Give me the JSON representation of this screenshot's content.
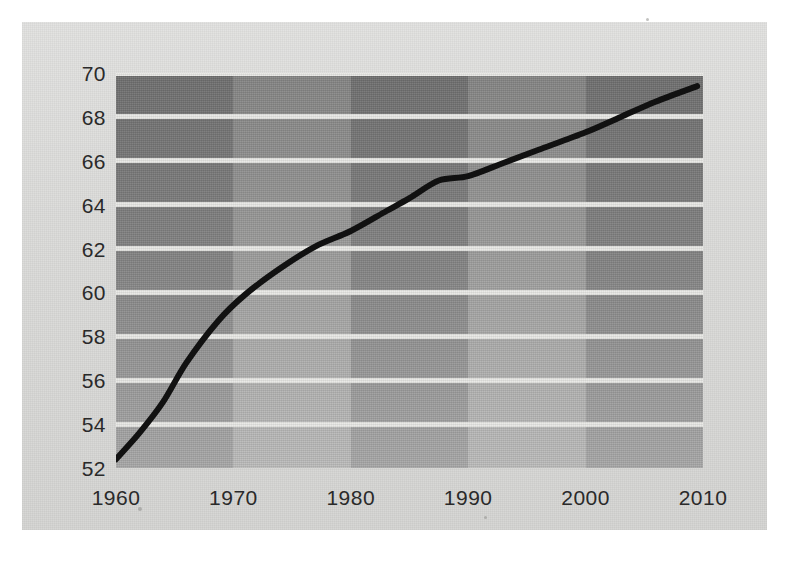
{
  "chart_data": {
    "type": "line",
    "title": "",
    "subtitle": "",
    "xlabel": "",
    "ylabel": "",
    "xlim": [
      1960,
      2010
    ],
    "ylim": [
      52,
      70
    ],
    "grid": true,
    "legend": false,
    "legend_position": "none",
    "line_color": "#111111",
    "line_width_px": 6,
    "x_ticks": [
      1960,
      1970,
      1980,
      1990,
      2000,
      2010
    ],
    "y_ticks": [
      52,
      54,
      56,
      58,
      60,
      62,
      64,
      66,
      68,
      70
    ],
    "x_tick_labels": [
      "1960",
      "1970",
      "1980",
      "1990",
      "2000",
      "2010"
    ],
    "y_tick_labels": [
      "52",
      "54",
      "56",
      "58",
      "60",
      "62",
      "64",
      "66",
      "68",
      "70"
    ],
    "series": [
      {
        "name": "value",
        "x": [
          1960,
          1962,
          1964,
          1966,
          1968.7,
          1971,
          1974,
          1977,
          1980,
          1983,
          1985,
          1987.5,
          1990,
          1993,
          1996,
          2000,
          2003,
          2006,
          2009.5
        ],
        "values": [
          52.4,
          53.6,
          55.0,
          56.8,
          58.7,
          59.9,
          61.1,
          62.1,
          62.8,
          63.7,
          64.3,
          65.1,
          65.3,
          65.9,
          66.5,
          67.3,
          68.0,
          68.7,
          69.4
        ]
      }
    ],
    "background_bands": [
      {
        "from": 1960,
        "to": 1970,
        "tone": "dark"
      },
      {
        "from": 1970,
        "to": 1980,
        "tone": "light"
      },
      {
        "from": 1980,
        "to": 1990,
        "tone": "dark"
      },
      {
        "from": 1990,
        "to": 2000,
        "tone": "light"
      },
      {
        "from": 2000,
        "to": 2010,
        "tone": "dark"
      }
    ],
    "colors": {
      "paper": "#d9d9d7",
      "band_dark": "#8a8a8a",
      "band_light": "#a5a5a4",
      "gridline": "#e9e9e6",
      "tick_text": "#2a2a2a",
      "line": "#111111"
    }
  }
}
